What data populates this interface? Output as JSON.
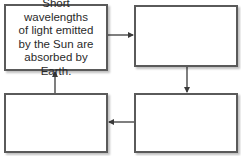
{
  "diagram": {
    "type": "cycle-flowchart",
    "boxes": [
      {
        "id": "box-1",
        "position": "top-left",
        "text": "Short wavelengths\nof light emitted\nby the Sun are\nabsorbed by Earth."
      },
      {
        "id": "box-2",
        "position": "top-right",
        "text": ""
      },
      {
        "id": "box-3",
        "position": "bottom-right",
        "text": ""
      },
      {
        "id": "box-4",
        "position": "bottom-left",
        "text": ""
      }
    ],
    "arrows": [
      {
        "from": "box-1",
        "to": "box-2",
        "direction": "right"
      },
      {
        "from": "box-2",
        "to": "box-3",
        "direction": "down"
      },
      {
        "from": "box-3",
        "to": "box-4",
        "direction": "left"
      },
      {
        "from": "box-4",
        "to": "box-1",
        "direction": "up"
      }
    ],
    "colors": {
      "border": "#5a5a5a",
      "arrow": "#3a3a3a",
      "text": "#2a2a2a"
    }
  }
}
